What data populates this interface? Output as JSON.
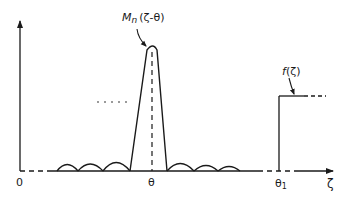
{
  "diagram": {
    "curve_label": {
      "main": "M",
      "sub": "n",
      "arg": "(ζ-θ)"
    },
    "step_label": {
      "name": "f",
      "arg": "(ζ)"
    },
    "axis": {
      "origin_label": "0",
      "peak_label": "θ",
      "step_label": "θ",
      "step_sub": "1",
      "x_label": "ζ"
    },
    "ellipsis": "....."
  },
  "colors": {
    "ink": "#1a1a1a",
    "background": "#ffffff"
  }
}
